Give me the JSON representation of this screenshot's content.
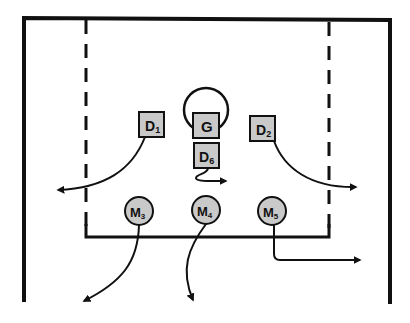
{
  "diagram": {
    "type": "play-diagram",
    "colors": {
      "line": "#111111",
      "player_fill": "#c9c9c9",
      "background": "#ffffff"
    },
    "players": [
      {
        "id": "D1",
        "letter": "D",
        "sub": "1",
        "shape": "square"
      },
      {
        "id": "G",
        "letter": "G",
        "sub": "",
        "shape": "square"
      },
      {
        "id": "D2",
        "letter": "D",
        "sub": "2",
        "shape": "square"
      },
      {
        "id": "D6",
        "letter": "D",
        "sub": "6",
        "shape": "square"
      },
      {
        "id": "M3",
        "letter": "M",
        "sub": "3",
        "shape": "circle"
      },
      {
        "id": "M4",
        "letter": "M",
        "sub": "4",
        "shape": "circle"
      },
      {
        "id": "M5",
        "letter": "M",
        "sub": "5",
        "shape": "circle"
      }
    ],
    "movements": [
      {
        "from": "D1",
        "direction": "curve down-left"
      },
      {
        "from": "D2",
        "direction": "curve down-right"
      },
      {
        "from": "D6",
        "direction": "short hook right"
      },
      {
        "from": "M3",
        "direction": "curve down-left"
      },
      {
        "from": "M4",
        "direction": "curve down"
      },
      {
        "from": "M5",
        "direction": "down then right"
      }
    ],
    "goal_crease": "circle around G"
  }
}
